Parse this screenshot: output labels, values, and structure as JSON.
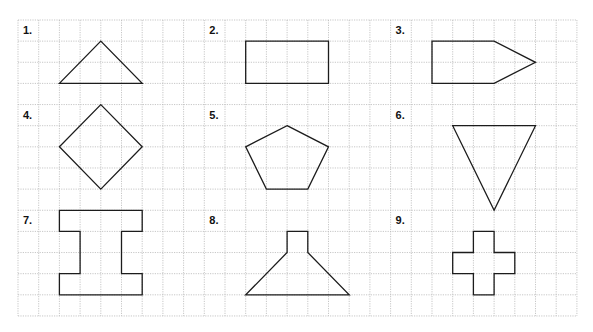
{
  "worksheet": {
    "grid": {
      "origin_x": 18,
      "origin_y": 20,
      "columns": 27,
      "rows": 14,
      "cell_width": 20.7,
      "cell_height": 21.14,
      "line_color": "#b9b9b9",
      "line_style": "dotted"
    },
    "stroke_color": "#1c1c1c",
    "figures": [
      {
        "label": "1.",
        "label_cell": [
          0,
          0
        ],
        "name": "triangle",
        "points": [
          [
            2,
            3
          ],
          [
            4,
            1
          ],
          [
            6,
            3
          ]
        ]
      },
      {
        "label": "2.",
        "label_cell": [
          9,
          0
        ],
        "name": "rectangle",
        "points": [
          [
            11,
            1
          ],
          [
            15,
            1
          ],
          [
            15,
            3
          ],
          [
            11,
            3
          ]
        ]
      },
      {
        "label": "3.",
        "label_cell": [
          18,
          0
        ],
        "name": "arrow-pentagon",
        "points": [
          [
            20,
            1
          ],
          [
            23,
            1
          ],
          [
            25,
            2
          ],
          [
            23,
            3
          ],
          [
            20,
            3
          ]
        ]
      },
      {
        "label": "4.",
        "label_cell": [
          0,
          4
        ],
        "name": "diamond",
        "points": [
          [
            4,
            4
          ],
          [
            6,
            6
          ],
          [
            4,
            8
          ],
          [
            2,
            6
          ]
        ]
      },
      {
        "label": "5.",
        "label_cell": [
          9,
          4
        ],
        "name": "pentagon",
        "points": [
          [
            13,
            5
          ],
          [
            15,
            6
          ],
          [
            14,
            8
          ],
          [
            12,
            8
          ],
          [
            11,
            6
          ]
        ]
      },
      {
        "label": "6.",
        "label_cell": [
          18,
          4
        ],
        "name": "inverted-triangle",
        "points": [
          [
            21,
            5
          ],
          [
            25,
            5
          ],
          [
            23,
            9
          ]
        ]
      },
      {
        "label": "7.",
        "label_cell": [
          0,
          9
        ],
        "name": "i-beam",
        "points": [
          [
            2,
            9
          ],
          [
            6,
            9
          ],
          [
            6,
            10
          ],
          [
            5,
            10
          ],
          [
            5,
            12
          ],
          [
            6,
            12
          ],
          [
            6,
            13
          ],
          [
            2,
            13
          ],
          [
            2,
            12
          ],
          [
            3,
            12
          ],
          [
            3,
            10
          ],
          [
            2,
            10
          ]
        ]
      },
      {
        "label": "8.",
        "label_cell": [
          9,
          9
        ],
        "name": "funnel",
        "points": [
          [
            13,
            10
          ],
          [
            14,
            10
          ],
          [
            14,
            11
          ],
          [
            16,
            13
          ],
          [
            11,
            13
          ],
          [
            13,
            11
          ]
        ]
      },
      {
        "label": "9.",
        "label_cell": [
          18,
          9
        ],
        "name": "cross",
        "points": [
          [
            22,
            10
          ],
          [
            23,
            10
          ],
          [
            23,
            11
          ],
          [
            24,
            11
          ],
          [
            24,
            12
          ],
          [
            23,
            12
          ],
          [
            23,
            13
          ],
          [
            22,
            13
          ],
          [
            22,
            12
          ],
          [
            21,
            12
          ],
          [
            21,
            11
          ],
          [
            22,
            11
          ]
        ]
      }
    ]
  }
}
